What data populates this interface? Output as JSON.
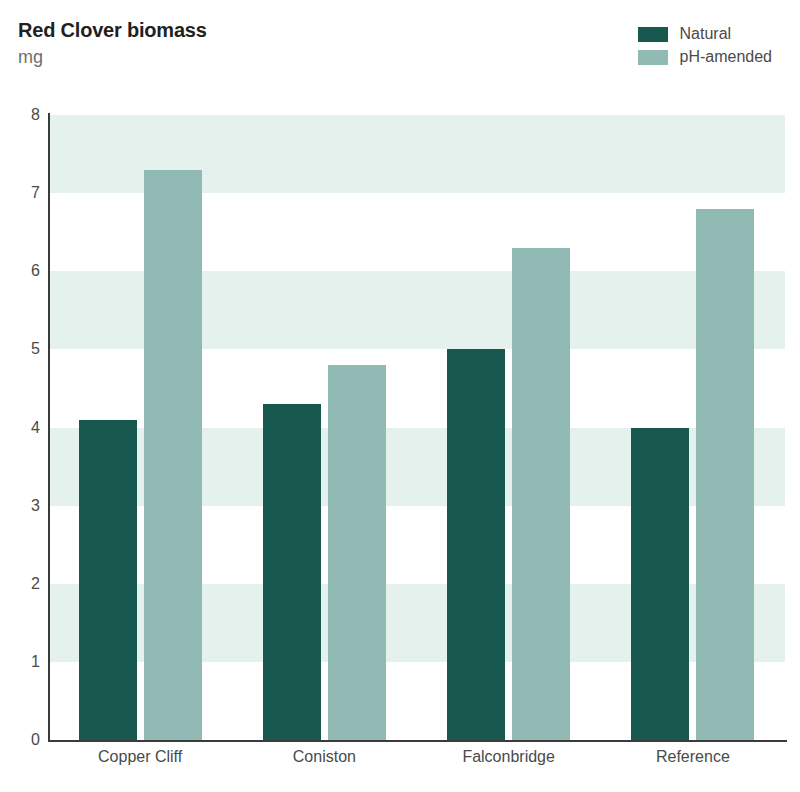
{
  "header": {
    "title": "Red Clover biomass",
    "subtitle": "mg"
  },
  "legend": {
    "position": "top-right",
    "items": [
      {
        "label": "Natural",
        "color": "#17594f"
      },
      {
        "label": "pH-amended",
        "color": "#91bab4"
      }
    ]
  },
  "colors": {
    "natural": "#17594f",
    "ph_amended": "#91bab4",
    "band": "#e4f1ec",
    "axis": "#3a3a3a",
    "text": "#4a4a4a",
    "title": "#231f20",
    "subtitle": "#6e6e6e",
    "background": "#ffffff"
  },
  "axes": {
    "y_ticks": [
      "8",
      "7",
      "6",
      "5",
      "4",
      "3",
      "2",
      "1",
      "0"
    ],
    "y_min": 0,
    "y_max": 8,
    "y_label": "mg",
    "x_categories": [
      "Copper Cliff",
      "Coniston",
      "Falconbridge",
      "Reference"
    ],
    "grid": "alternating-horizontal-bands"
  },
  "chart_data": {
    "type": "bar",
    "title": "Red Clover biomass",
    "subtitle": "mg",
    "xlabel": "",
    "ylabel": "mg",
    "ylim": [
      0,
      8
    ],
    "yticks": [
      0,
      1,
      2,
      3,
      4,
      5,
      6,
      7,
      8
    ],
    "grid": true,
    "legend_position": "top-right",
    "categories": [
      "Copper Cliff",
      "Coniston",
      "Falconbridge",
      "Reference"
    ],
    "series": [
      {
        "name": "Natural",
        "color": "#17594f",
        "values": [
          4.1,
          4.3,
          5.0,
          4.0
        ]
      },
      {
        "name": "pH-amended",
        "color": "#91bab4",
        "values": [
          7.3,
          4.8,
          6.3,
          6.8
        ]
      }
    ]
  }
}
